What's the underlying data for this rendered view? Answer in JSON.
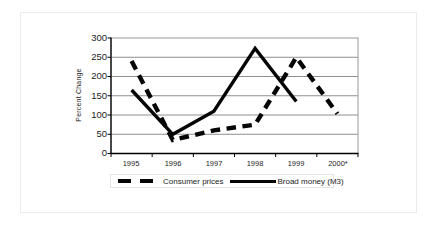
{
  "chart_data": {
    "type": "line",
    "title": "",
    "xlabel": "",
    "ylabel": "Percent Change",
    "categories": [
      "1995",
      "1996",
      "1997",
      "1998",
      "1999",
      "2000*"
    ],
    "yticks": [
      0,
      50,
      100,
      150,
      200,
      250,
      300
    ],
    "ylim": [
      0,
      300
    ],
    "grid": "horizontal",
    "legend_position": "bottom",
    "axis_color": "#000000",
    "gridline_color": "#8f8f8f",
    "series": [
      {
        "name": "Consumer prices",
        "style": "dashed",
        "color": "#050505",
        "values": [
          240,
          35,
          60,
          75,
          250,
          103
        ]
      },
      {
        "name": "Broad money (M3)",
        "style": "solid",
        "color": "#050505",
        "values": [
          165,
          50,
          110,
          273,
          135,
          null
        ]
      }
    ]
  }
}
